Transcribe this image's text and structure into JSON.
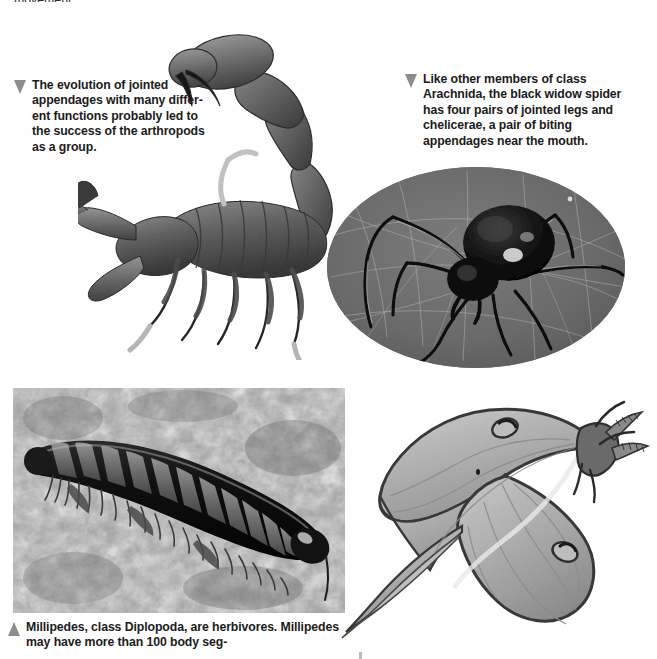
{
  "page": {
    "background_color": "#ffffff",
    "width": 657,
    "height": 659,
    "clipped_top_text": "movement.",
    "text_color": "#1b1b1b",
    "marker_color": "#8d8d8d"
  },
  "captions": {
    "scorpion": {
      "marker": "triangle-down-marker",
      "text": "The evolution of jointed appendages with many differ-\nent functions probably led to the success of the arthropods as a group."
    },
    "spider": {
      "marker": "triangle-down-marker",
      "text": "Like other members of class Arachnida, the black widow spider has four pairs of jointed legs and chelicerae, a pair of biting appendages near the mouth."
    },
    "millipede": {
      "marker": "triangle-up-marker",
      "text": "Millipedes, class Diplopoda, are herbivores. Millipedes may have more than 100 body seg-"
    }
  },
  "figures": {
    "scorpion": {
      "name": "scorpion-photo",
      "subject": "scorpion",
      "shape": "cutout",
      "style": "grayscale photograph on white background"
    },
    "spider": {
      "name": "black-widow-spider-photo",
      "subject": "black widow spider on web",
      "shape": "oval",
      "background_color": "#6e6e6e",
      "style": "grayscale photograph"
    },
    "millipede": {
      "name": "millipede-photo",
      "subject": "millipede on mottled rock",
      "shape": "rectangle",
      "background_color": "#8a8a8a",
      "style": "grayscale photograph"
    },
    "moth": {
      "name": "luna-moth-photo",
      "subject": "luna moth",
      "shape": "cutout",
      "style": "grayscale photograph on white background"
    }
  }
}
